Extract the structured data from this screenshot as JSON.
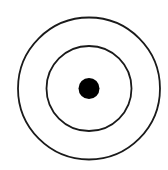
{
  "diagram": {
    "type": "concentric-target",
    "canvas": {
      "width": 168,
      "height": 170,
      "background": "#ffffff"
    },
    "center": {
      "cx": 89,
      "cy": 88.5
    },
    "stroke_color": "#1a1a1a",
    "stroke_width": 1.8,
    "rings": [
      {
        "name": "outer-ring",
        "r": 71
      },
      {
        "name": "inner-ring",
        "r": 42.5
      }
    ],
    "center_dot": {
      "r": 10.5,
      "fill": "#000000"
    }
  }
}
